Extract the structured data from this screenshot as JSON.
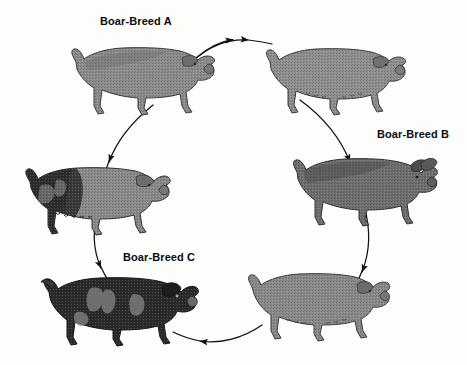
{
  "diagram": {
    "title_visible": false,
    "type": "rotational-crossbreeding-cycle",
    "background_color": "#fdfdfc",
    "ink_color": "#111111"
  },
  "labels": [
    {
      "id": "label-a",
      "text": "Boar-Breed A",
      "x": 100,
      "y": 16
    },
    {
      "id": "label-b",
      "text": "Boar-Breed B",
      "x": 377,
      "y": 129
    },
    {
      "id": "label-c",
      "text": "Boar-Breed C",
      "x": 123,
      "y": 252
    }
  ],
  "animals": [
    {
      "id": "pig-top-left",
      "name": "sow-top-left",
      "facing": "right",
      "coat": "solid-gray",
      "body_color": "#8c8c8c",
      "shade_color": "#6e6e6e",
      "x": 62,
      "y": 36,
      "w": 160,
      "h": 82
    },
    {
      "id": "pig-top-right",
      "name": "sow-top-right",
      "facing": "right",
      "coat": "solid-gray",
      "body_color": "#8f8f8f",
      "shade_color": "#717171",
      "x": 258,
      "y": 38,
      "w": 150,
      "h": 78
    },
    {
      "id": "pig-right-middle",
      "name": "boar-breed-b-animal",
      "facing": "right",
      "coat": "dark-gray",
      "body_color": "#6f6f6f",
      "shade_color": "#4c4c4c",
      "x": 283,
      "y": 147,
      "w": 156,
      "h": 80
    },
    {
      "id": "pig-bottom-right",
      "name": "sow-bottom-right",
      "facing": "right",
      "coat": "solid-gray",
      "body_color": "#8a8a8a",
      "shade_color": "#6b6b6b",
      "x": 240,
      "y": 263,
      "w": 152,
      "h": 78
    },
    {
      "id": "pig-bottom-left",
      "name": "boar-breed-c-animal",
      "facing": "right",
      "coat": "black-with-light-patches",
      "body_color": "#2b2b2b",
      "shade_color": "#7d7d7d",
      "x": 33,
      "y": 264,
      "w": 168,
      "h": 84
    },
    {
      "id": "pig-left-middle",
      "name": "sow-left-middle",
      "facing": "right",
      "coat": "black-front-gray-rear",
      "body_color": "#8b8b8b",
      "shade_color": "#2e2e2e",
      "x": 16,
      "y": 156,
      "w": 160,
      "h": 80
    }
  ],
  "arrows": [
    {
      "id": "arrow-top",
      "from": "pig-top-left",
      "to": "pig-top-right",
      "direction": "right"
    },
    {
      "id": "arrow-right-upper",
      "from": "pig-top-right",
      "to": "pig-right-middle",
      "direction": "down"
    },
    {
      "id": "arrow-right-lower",
      "from": "pig-right-middle",
      "to": "pig-bottom-right",
      "direction": "down"
    },
    {
      "id": "arrow-bottom",
      "from": "pig-bottom-right",
      "to": "pig-bottom-left",
      "direction": "left"
    },
    {
      "id": "arrow-left-lower",
      "from": "pig-left-middle",
      "to": "pig-bottom-left",
      "direction": "down"
    },
    {
      "id": "arrow-left-upper",
      "from": "pig-top-left",
      "to": "pig-left-middle",
      "direction": "up"
    }
  ],
  "arrow_paths": {
    "top": "M 196 58 C 222 40 248 37 272 44",
    "right_upper": "M 300 100 C 330 118 348 140 356 172",
    "right_lower": "M 363 205 C 372 236 368 266 352 292",
    "bottom": "M 258 322 C 234 339 206 344 178 336",
    "left_lower": "M 100 208 C 92 238 97 268 112 292",
    "left_upper": "M 152 104 C 126 120 110 142 103 172"
  }
}
